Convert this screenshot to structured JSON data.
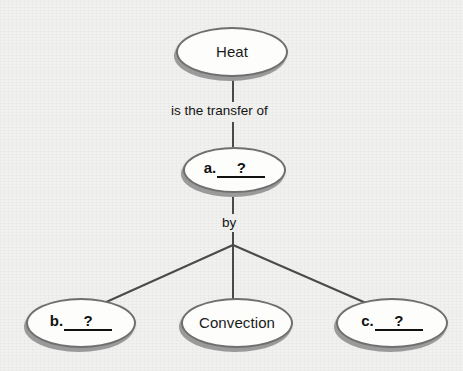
{
  "diagram": {
    "type": "concept-map",
    "background_color": "#f1f1ef",
    "node_fill_color": "#fdfdfc",
    "node_border_color": "#6f6f6f",
    "shadow_color": "#9a9a9a",
    "line_color": "#4a4a4a",
    "text_color": "#1a1a1a"
  },
  "nodes": {
    "heat": {
      "label": "Heat",
      "kind": "filled"
    },
    "a": {
      "prefix": "a.",
      "slot": "?",
      "kind": "blank"
    },
    "b": {
      "prefix": "b.",
      "slot": "?",
      "kind": "blank"
    },
    "convection": {
      "label": "Convection",
      "kind": "filled"
    },
    "c": {
      "prefix": "c.",
      "slot": "?",
      "kind": "blank"
    }
  },
  "edge_labels": {
    "heat_to_a": "is the transfer of",
    "a_to_methods": "by"
  }
}
